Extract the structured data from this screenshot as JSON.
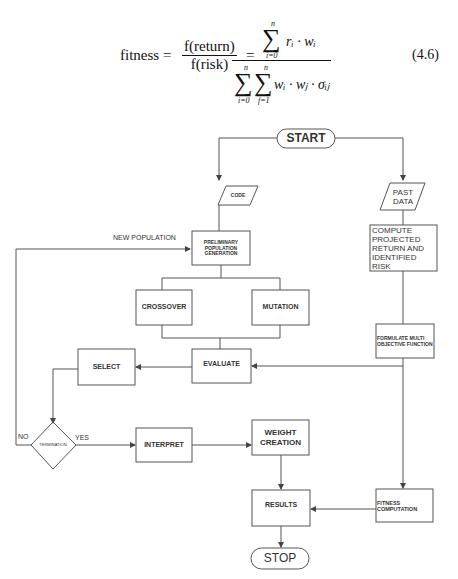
{
  "formula": {
    "lhs": "fitness =",
    "frac1_num": "f(return)",
    "frac1_den": "f(risk)",
    "eq2": "=",
    "num_sum_upper": "n",
    "num_sum_lower": "i=0",
    "num_expr": "rᵢ · wᵢ",
    "den_sum1_upper": "n",
    "den_sum1_lower": "i=0",
    "den_sum2_upper": "n",
    "den_sum2_lower": "f=1",
    "den_expr": "wᵢ · wⱼ · σᵢⱼ",
    "equation_number": "(4.6)"
  },
  "flowchart": {
    "start": "START",
    "code": "CODE",
    "past_data": "PAST DATA",
    "compute": "COMPUTE PROJECTED RETURN AND IDENTIFIED RISK",
    "new_population": "NEW POPULATION",
    "preliminary": "PRELIMINARY POPULATION GENERATION",
    "crossover": "CROSSOVER",
    "mutation": "MUTATION",
    "formulate": "FORMULATE MULTI OBJECTIVE FUNCTION",
    "select": "SELECT",
    "evaluate": "EVALUATE",
    "termination": "TERMINATION",
    "no": "NO",
    "yes": "YES",
    "interpret": "INTERPRET",
    "weight_creation": "WEIGHT CREATION",
    "results": "RESULTS",
    "fitness_computation": "FITNESS COMPUTATION",
    "stop": "STOP"
  }
}
